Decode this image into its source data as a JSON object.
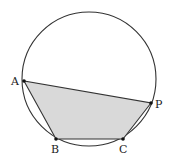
{
  "diagram": {
    "type": "inscribed-polygon-in-circle",
    "circle": {
      "cx": 89,
      "cy": 79,
      "r": 67,
      "stroke": "#333333"
    },
    "fill_color": "#d9d9d9",
    "points": [
      {
        "label": "A",
        "x": 24,
        "y": 81,
        "lx": 11,
        "ly": 85
      },
      {
        "label": "B",
        "x": 56,
        "y": 139,
        "lx": 51,
        "ly": 152
      },
      {
        "label": "C",
        "x": 123,
        "y": 139,
        "lx": 119,
        "ly": 152
      },
      {
        "label": "P",
        "x": 151,
        "y": 103,
        "lx": 155,
        "ly": 107
      }
    ],
    "polygon_order": [
      "A",
      "B",
      "C",
      "P"
    ]
  }
}
